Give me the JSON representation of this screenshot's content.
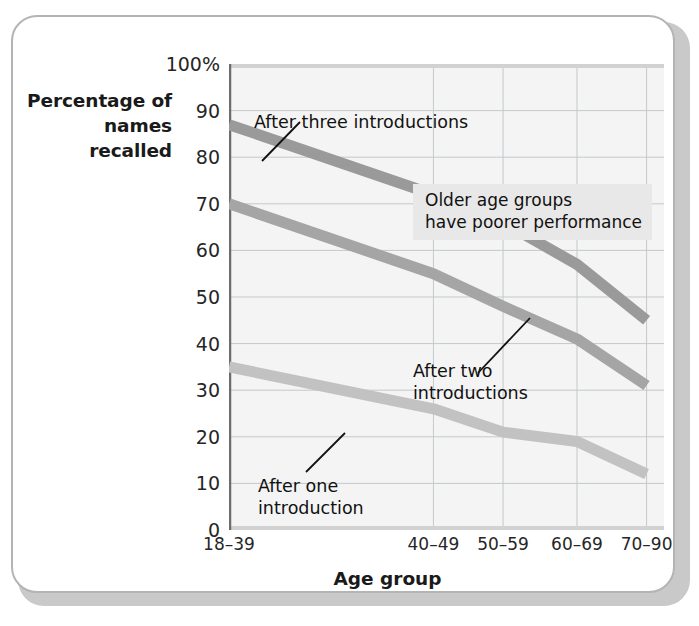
{
  "chart_data": {
    "type": "line",
    "title": "",
    "subtitle": "",
    "xlabel": "Age group",
    "ylabel": "Percentage\nof names\nrecalled",
    "categories": [
      "18–39",
      "40–49",
      "50–59",
      "60–69",
      "70–90"
    ],
    "category_positions_pct": [
      0,
      47,
      63,
      80,
      96
    ],
    "ylim": [
      0,
      100
    ],
    "ytick_values": [
      0,
      10,
      20,
      30,
      40,
      50,
      60,
      70,
      80,
      90,
      100
    ],
    "ytick_labels": [
      "0",
      "10",
      "20",
      "30",
      "40",
      "50",
      "60",
      "70",
      "80",
      "90",
      "100%"
    ],
    "grid": true,
    "grid_color": "#c3c9cc",
    "plot_background": "#f4f4f4",
    "legend_position": "inline-annotations",
    "series": [
      {
        "name": "After three introductions",
        "values": [
          87,
          72,
          66,
          57,
          45
        ],
        "color": "#9a9a9a"
      },
      {
        "name": "After two introductions",
        "values": [
          70,
          55,
          48,
          41,
          31
        ],
        "color": "#a5a5a5"
      },
      {
        "name": "After one introduction",
        "values": [
          35,
          26,
          21,
          19,
          12
        ],
        "color": "#c2c2c2"
      }
    ],
    "annotations": [
      {
        "id": "after-three",
        "text": "After three introductions",
        "target_series": "After three introductions"
      },
      {
        "id": "after-two",
        "text": "After two\nintroductions",
        "target_series": "After two introductions"
      },
      {
        "id": "after-one",
        "text": "After one\nintroduction",
        "target_series": "After one introduction"
      }
    ],
    "callout": {
      "text": "Older age groups\nhave poorer performance",
      "background": "#e8e8e8"
    }
  },
  "figure": {
    "card_background": "#ffffff",
    "card_border_color": "#b4b4b4",
    "shadow_color": "#c9c9c9"
  }
}
